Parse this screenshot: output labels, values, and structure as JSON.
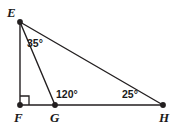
{
  "figure": {
    "type": "geometry-diagram",
    "background_color": "#ffffff",
    "stroke_color": "#231f20",
    "label_color": "#1a1a1a",
    "width": 180,
    "height": 129,
    "vertices": [
      {
        "id": "E",
        "label": "E",
        "x": 20,
        "y": 22,
        "label_x": 7,
        "label_y": 6
      },
      {
        "id": "F",
        "label": "F",
        "x": 20,
        "y": 105,
        "label_x": 14,
        "label_y": 111
      },
      {
        "id": "G",
        "label": "G",
        "x": 55,
        "y": 105,
        "label_x": 50,
        "label_y": 111
      },
      {
        "id": "H",
        "label": "H",
        "x": 163,
        "y": 105,
        "label_x": 159,
        "label_y": 111
      }
    ],
    "segments": [
      {
        "id": "EF",
        "from": "E",
        "to": "F"
      },
      {
        "id": "EG",
        "from": "E",
        "to": "G"
      },
      {
        "id": "EH",
        "from": "E",
        "to": "H"
      },
      {
        "id": "FH",
        "from": "F",
        "to": "H"
      }
    ],
    "right_angle": {
      "at": "F",
      "size": 9
    },
    "angles": [
      {
        "id": "angle-FEG",
        "vertex": "E",
        "value": "35°",
        "label_x": 27,
        "label_y": 38
      },
      {
        "id": "angle-EGH",
        "vertex": "G",
        "value": "120°",
        "label_x": 56,
        "label_y": 89
      },
      {
        "id": "angle-EHF",
        "vertex": "H",
        "value": "25°",
        "label_x": 122,
        "label_y": 89
      }
    ]
  }
}
